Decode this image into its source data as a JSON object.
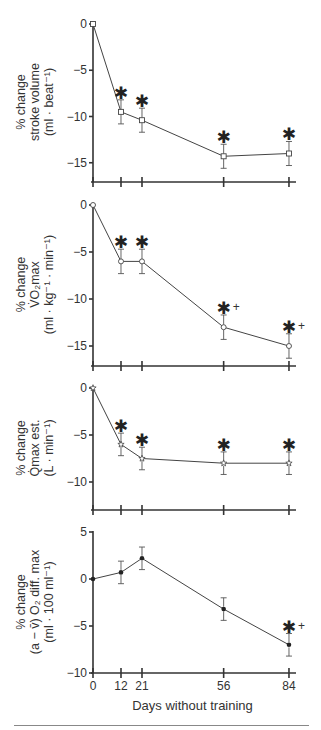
{
  "chart_data": [
    {
      "type": "line",
      "panel": 1,
      "ylabel_lines": [
        "% change",
        "stroke volume",
        "(ml · beat⁻¹)"
      ],
      "x": [
        0,
        12,
        21,
        56,
        84
      ],
      "values": [
        0,
        -9.5,
        -10.4,
        -14.3,
        -14.0
      ],
      "error_plus": [
        0,
        1.3,
        1.3,
        1.3,
        1.3
      ],
      "error_minus": [
        0,
        1.3,
        1.3,
        1.3,
        1.3
      ],
      "marker": "open-square",
      "annotations": [
        "",
        "*",
        "*",
        "*",
        "*"
      ],
      "yticks": [
        0,
        -5,
        -10,
        -15
      ],
      "ylim": [
        -17,
        0
      ]
    },
    {
      "type": "line",
      "panel": 2,
      "ylabel_lines": [
        "% change",
        "V̇O₂max",
        "(ml · kg⁻¹ · min⁻¹)"
      ],
      "x": [
        0,
        12,
        21,
        56,
        84
      ],
      "values": [
        0,
        -6,
        -6,
        -13,
        -15
      ],
      "error_plus": [
        0,
        1.3,
        1.3,
        1.3,
        1.3
      ],
      "error_minus": [
        0,
        1.3,
        1.3,
        1.3,
        1.3
      ],
      "marker": "open-circle",
      "annotations": [
        "",
        "*",
        "*",
        "*+",
        "*+"
      ],
      "yticks": [
        0,
        -5,
        -10,
        -15
      ],
      "ylim": [
        -17,
        0
      ]
    },
    {
      "type": "line",
      "panel": 3,
      "ylabel_lines": [
        "% change",
        "Q̇max est.",
        "(L · min⁻¹)"
      ],
      "x": [
        0,
        12,
        21,
        56,
        84
      ],
      "values": [
        0,
        -6,
        -7.5,
        -8,
        -8
      ],
      "error_plus": [
        0,
        1.2,
        1.2,
        1.2,
        1.2
      ],
      "error_minus": [
        0,
        1.2,
        1.2,
        1.2,
        1.2
      ],
      "marker": "open-star",
      "annotations": [
        "",
        "*",
        "*",
        "*",
        "*"
      ],
      "yticks": [
        0,
        -5,
        -10
      ],
      "ylim": [
        -13,
        0
      ]
    },
    {
      "type": "line",
      "panel": 4,
      "ylabel_lines": [
        "% change",
        "(a − v̄) O₂ diff. max",
        "(ml · 100 ml⁻¹)"
      ],
      "x": [
        0,
        12,
        21,
        56,
        84
      ],
      "values": [
        0,
        0.7,
        2.2,
        -3.2,
        -7.0
      ],
      "error_plus": [
        0,
        1.2,
        1.2,
        1.2,
        1.2
      ],
      "error_minus": [
        0,
        1.2,
        1.2,
        1.2,
        1.2
      ],
      "marker": "filled-circle",
      "annotations": [
        "",
        "",
        "",
        "",
        "*+"
      ],
      "yticks": [
        5,
        0,
        -5,
        -10
      ],
      "ylim": [
        -10,
        5
      ]
    }
  ],
  "xaxis": {
    "label": "Days without training",
    "ticks": [
      0,
      12,
      21,
      56,
      84
    ]
  }
}
